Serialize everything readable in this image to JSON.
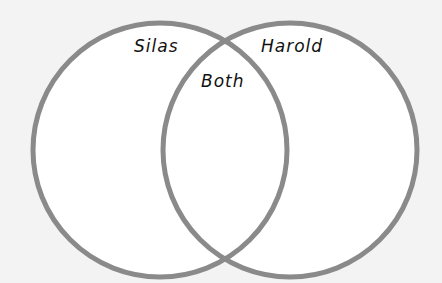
{
  "diagram": {
    "type": "venn",
    "sets": [
      {
        "label": "Silas",
        "cx": 160,
        "cy": 150,
        "r": 127
      },
      {
        "label": "Harold",
        "cx": 290,
        "cy": 150,
        "r": 127
      }
    ],
    "intersection_label": "Both",
    "colors": {
      "background": "#f3f3f3",
      "circle_fill": "#ffffff",
      "circle_stroke": "#8a8a8a",
      "text": "#111111"
    }
  }
}
